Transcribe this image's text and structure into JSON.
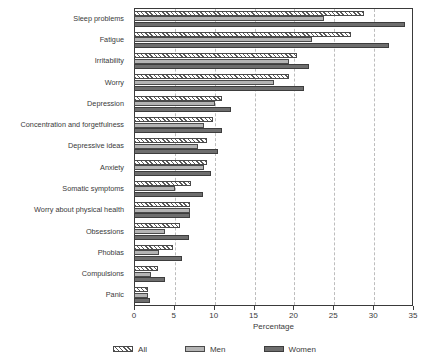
{
  "chart_data": {
    "type": "bar",
    "orientation": "horizontal",
    "title": "",
    "xlabel": "Percentage",
    "ylabel": "",
    "xlim": [
      0,
      35
    ],
    "xticks": [
      0,
      5,
      10,
      15,
      20,
      25,
      30,
      35
    ],
    "grid": "vertical-dashed",
    "legend_position": "bottom",
    "categories": [
      "Sleep problems",
      "Fatigue",
      "Irritability",
      "Worry",
      "Depression",
      "Concentration and forgetfulness",
      "Depressive ideas",
      "Anxiety",
      "Somatic symptoms",
      "Worry about physical health",
      "Obsessions",
      "Phobias",
      "Compulsions",
      "Panic"
    ],
    "series": [
      {
        "name": "All",
        "color": "#e8e8e8",
        "pattern": "diagonal-hatch",
        "values": [
          28.8,
          27.2,
          20.5,
          19.5,
          11.1,
          9.9,
          9.2,
          9.1,
          7.1,
          7.0,
          5.8,
          4.9,
          3.0,
          1.8
        ]
      },
      {
        "name": "Men",
        "color": "#b4b4b4",
        "pattern": "solid",
        "values": [
          23.8,
          22.3,
          19.5,
          17.5,
          10.2,
          8.8,
          8.0,
          8.8,
          5.2,
          7.0,
          3.9,
          3.1,
          2.1,
          1.7
        ]
      },
      {
        "name": "Women",
        "color": "#6e6e6e",
        "pattern": "solid",
        "values": [
          34.0,
          32.0,
          22.0,
          21.3,
          12.2,
          11.0,
          10.6,
          9.6,
          8.6,
          7.0,
          6.9,
          6.0,
          3.9,
          2.0
        ]
      }
    ]
  },
  "legend": {
    "items": [
      {
        "label": "All"
      },
      {
        "label": "Men"
      },
      {
        "label": "Women"
      }
    ]
  },
  "colors": {
    "axis": "#3a3a3a",
    "grid": "#bdbdbd",
    "all": "#e8e8e8",
    "men": "#b4b4b4",
    "women": "#6e6e6e",
    "background": "#ffffff"
  }
}
